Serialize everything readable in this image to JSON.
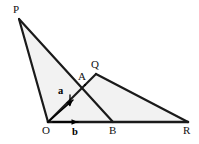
{
  "figure": {
    "width": 199,
    "height": 144,
    "background_color": "#ffffff",
    "stroke_color": "#1a1a1a",
    "shade_color": "#f2f2f2",
    "stroke_width": 2.2
  },
  "points": {
    "P": {
      "label": "P",
      "x": 19,
      "y": 19,
      "label_x": 13,
      "label_y": 4
    },
    "O": {
      "label": "O",
      "x": 48,
      "y": 122,
      "label_x": 42,
      "label_y": 125
    },
    "B": {
      "label": "B",
      "x": 113,
      "y": 122,
      "label_x": 109,
      "label_y": 125
    },
    "R": {
      "label": "R",
      "x": 188,
      "y": 122,
      "label_x": 183,
      "label_y": 125
    },
    "Q": {
      "label": "Q",
      "x": 96,
      "y": 74,
      "label_x": 91,
      "label_y": 59
    },
    "A": {
      "label": "A",
      "x": 85,
      "y": 85,
      "label_x": 78,
      "label_y": 71
    }
  },
  "edges": [
    {
      "name": "edge-P-O",
      "from": "P",
      "to": "O"
    },
    {
      "name": "edge-P-B",
      "from": "P",
      "to": "B"
    },
    {
      "name": "edge-O-Q",
      "from": "O",
      "to": "Q"
    },
    {
      "name": "edge-O-R",
      "from": "O",
      "to": "R"
    },
    {
      "name": "edge-Q-R",
      "from": "Q",
      "to": "R"
    }
  ],
  "shaded_regions": [
    {
      "name": "triangle-P-O-B",
      "vertices": [
        "P",
        "O",
        "B"
      ]
    },
    {
      "name": "triangle-O-Q-R",
      "vertices": [
        "O",
        "Q",
        "R"
      ]
    }
  ],
  "vectors": [
    {
      "name": "vector-a",
      "label": "a",
      "from_x": 48,
      "from_y": 122,
      "to_x": 73,
      "to_y": 100,
      "label_x": 58,
      "label_y": 86,
      "tick_x1": 70,
      "tick_y1": 95,
      "tick_x2": 70,
      "tick_y2": 105
    },
    {
      "name": "vector-b",
      "label": "b",
      "from_x": 53,
      "from_y": 122,
      "to_x": 78,
      "to_y": 122,
      "label_x": 72,
      "label_y": 127,
      "tick_x1": 0,
      "tick_y1": 0,
      "tick_x2": 0,
      "tick_y2": 0
    }
  ]
}
